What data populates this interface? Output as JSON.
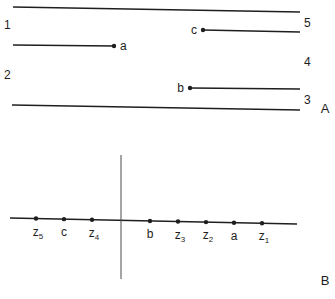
{
  "panel_a": {
    "label": "A",
    "boundary_lines": [
      {
        "name": "top-boundary-line",
        "x1": 13,
        "y1": 7,
        "x2": 300,
        "y2": 12
      },
      {
        "name": "bottom-boundary-line",
        "x1": 12,
        "y1": 105,
        "x2": 300,
        "y2": 110
      }
    ],
    "segments": [
      {
        "name": "segment-a",
        "label": "a",
        "x1": 13,
        "y1": 45,
        "x2": 114,
        "y2": 46,
        "dot_x": 114,
        "dot_y": 46,
        "label_x": 120,
        "label_y": 50,
        "label_anchor": "start"
      },
      {
        "name": "segment-c",
        "label": "c",
        "x1": 203,
        "y1": 30,
        "x2": 300,
        "y2": 32,
        "dot_x": 203,
        "dot_y": 30,
        "label_x": 197,
        "label_y": 34,
        "label_anchor": "end"
      },
      {
        "name": "segment-b",
        "label": "b",
        "x1": 190,
        "y1": 88,
        "x2": 300,
        "y2": 89,
        "dot_x": 190,
        "dot_y": 88,
        "label_x": 184,
        "label_y": 92,
        "label_anchor": "end"
      }
    ],
    "region_numbers": [
      {
        "label": "1",
        "x": 4,
        "y": 29
      },
      {
        "label": "2",
        "x": 4,
        "y": 79
      },
      {
        "label": "3",
        "x": 304,
        "y": 104
      },
      {
        "label": "4",
        "x": 304,
        "y": 66
      },
      {
        "label": "5",
        "x": 304,
        "y": 27
      }
    ]
  },
  "panel_b": {
    "label": "B",
    "axis_line": {
      "x1": 10,
      "y1": 218,
      "x2": 297,
      "y2": 224
    },
    "vertical_line": {
      "x": 121,
      "y1": 155,
      "y2": 279
    },
    "points": [
      {
        "name": "z5",
        "base": "z",
        "sub": "5",
        "x": 36
      },
      {
        "name": "c",
        "base": "c",
        "sub": "",
        "x": 64
      },
      {
        "name": "z4",
        "base": "z",
        "sub": "4",
        "x": 92
      },
      {
        "name": "b",
        "base": "b",
        "sub": "",
        "x": 150
      },
      {
        "name": "z3",
        "base": "z",
        "sub": "3",
        "x": 178
      },
      {
        "name": "z2",
        "base": "z",
        "sub": "2",
        "x": 206
      },
      {
        "name": "a",
        "base": "a",
        "sub": "",
        "x": 234
      },
      {
        "name": "z1",
        "base": "z",
        "sub": "1",
        "x": 262
      }
    ]
  },
  "labels": {
    "panel_a": "A",
    "panel_b": "B"
  }
}
